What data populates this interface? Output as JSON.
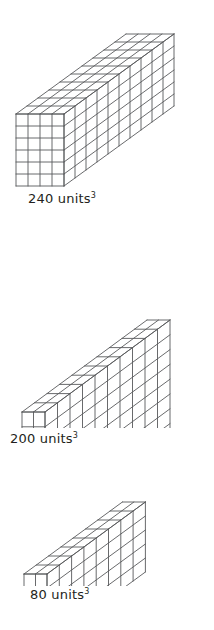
{
  "page": {
    "background_color": "#ffffff",
    "stroke_color": "#58595b",
    "text_color": "#231f20",
    "width": 214,
    "height": 630
  },
  "figures": [
    {
      "id": "prism-240",
      "name": "rectangular-prism-240",
      "caption_number": "240",
      "caption_unit": "units",
      "caption_exponent": "3",
      "caption_full": "240 units3",
      "dimensions": {
        "width_cubes": 4,
        "height_cubes": 6,
        "depth_cubes": 10
      },
      "volume": 240
    },
    {
      "id": "prism-200",
      "name": "rectangular-prism-200",
      "caption_number": "200",
      "caption_unit": "units",
      "caption_exponent": "3",
      "caption_full": "200 units3",
      "dimensions": {
        "width_cubes": 2,
        "height_cubes": 10,
        "depth_cubes": 10
      },
      "volume": 200
    },
    {
      "id": "prism-80",
      "name": "rectangular-prism-80",
      "caption_number": "80",
      "caption_unit": "units",
      "caption_exponent": "3",
      "caption_full": "80 units3",
      "dimensions": {
        "width_cubes": 2,
        "height_cubes": 5,
        "depth_cubes": 8
      },
      "volume": 80
    }
  ],
  "chart_data": {
    "type": "bar",
    "title": "",
    "xlabel": "",
    "ylabel": "Volume (units cubed)",
    "categories": [
      "240 units3",
      "200 units3",
      "80 units3"
    ],
    "values": [
      240,
      200,
      80
    ],
    "ylim": [
      0,
      240
    ],
    "grid": false,
    "legend": "none",
    "annotations": [
      "4 x 6 x 10 = 240",
      "2 x 10 x 10 = 200",
      "2 x 5 x 8 = 80"
    ]
  }
}
